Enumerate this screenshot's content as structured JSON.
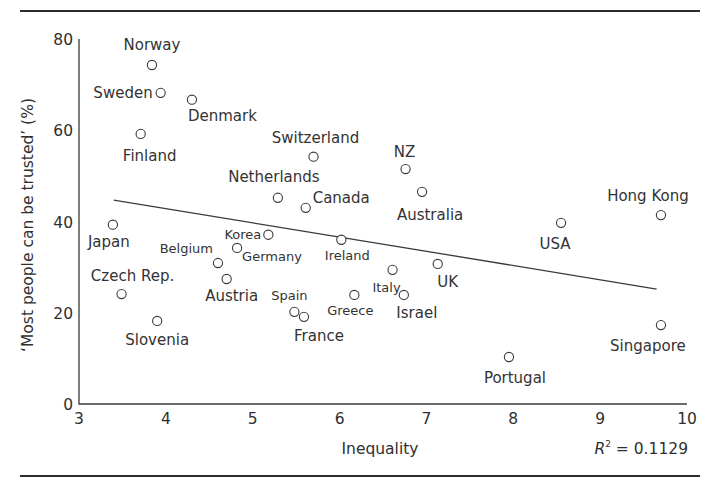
{
  "chart_data": {
    "type": "scatter",
    "title": "",
    "xlabel": "Inequality",
    "ylabel": "‘Most people can be trusted’ (%)",
    "xlim": [
      3,
      10
    ],
    "ylim": [
      0,
      80
    ],
    "x_ticks": [
      "3",
      "4",
      "5",
      "6",
      "7",
      "8",
      "9",
      "10"
    ],
    "y_ticks": [
      "0",
      "20",
      "40",
      "60",
      "80"
    ],
    "grid": false,
    "legend": null,
    "annotation": {
      "r2_label": "R",
      "r2_sup": "2",
      "r2_value": " = 0.1129"
    },
    "trendline": {
      "x": [
        3.4,
        9.65
      ],
      "y": [
        44.7,
        25.2
      ]
    },
    "points": [
      {
        "label": "Norway",
        "x": 3.84,
        "y": 74.3,
        "lx": 0,
        "ly": -15,
        "anchor": "middle",
        "size": "normal"
      },
      {
        "label": "Sweden",
        "x": 3.94,
        "y": 68.2,
        "lx": -8,
        "ly": 5,
        "anchor": "end",
        "size": "normal"
      },
      {
        "label": "Denmark",
        "x": 4.3,
        "y": 66.7,
        "lx": -4,
        "ly": 21,
        "anchor": "start",
        "size": "normal"
      },
      {
        "label": "Finland",
        "x": 3.71,
        "y": 59.2,
        "lx": 9,
        "ly": 27,
        "anchor": "middle",
        "size": "normal"
      },
      {
        "label": "Switzerland",
        "x": 5.7,
        "y": 54.2,
        "lx": 2,
        "ly": -14,
        "anchor": "middle",
        "size": "normal"
      },
      {
        "label": "NZ",
        "x": 6.76,
        "y": 51.5,
        "lx": -1,
        "ly": -12,
        "anchor": "middle",
        "size": "normal"
      },
      {
        "label": "Netherlands",
        "x": 5.29,
        "y": 45.2,
        "lx": -4,
        "ly": -16,
        "anchor": "middle",
        "size": "normal"
      },
      {
        "label": "Canada",
        "x": 5.61,
        "y": 43.0,
        "lx": 7,
        "ly": -5,
        "anchor": "start",
        "size": "normal"
      },
      {
        "label": "Australia",
        "x": 6.95,
        "y": 46.5,
        "lx": 8,
        "ly": 28,
        "anchor": "middle",
        "size": "normal"
      },
      {
        "label": "Japan",
        "x": 3.39,
        "y": 39.3,
        "lx": -4,
        "ly": 22,
        "anchor": "middle",
        "size": "normal"
      },
      {
        "label": "Korea",
        "x": 5.18,
        "y": 37.1,
        "lx": -7,
        "ly": 4,
        "anchor": "end",
        "size": "small"
      },
      {
        "label": "Ireland",
        "x": 6.02,
        "y": 36.0,
        "lx": 6,
        "ly": 20,
        "anchor": "middle",
        "size": "small"
      },
      {
        "label": "Germany",
        "x": 4.82,
        "y": 34.2,
        "lx": 5,
        "ly": 13,
        "anchor": "start",
        "size": "small"
      },
      {
        "label": "Belgium",
        "x": 4.6,
        "y": 30.9,
        "lx": -5,
        "ly": -10,
        "anchor": "end",
        "size": "small"
      },
      {
        "label": "Austria",
        "x": 4.7,
        "y": 27.4,
        "lx": 5,
        "ly": 22,
        "anchor": "middle",
        "size": "normal"
      },
      {
        "label": "Italy",
        "x": 6.61,
        "y": 29.4,
        "lx": -6,
        "ly": 22,
        "anchor": "middle",
        "size": "small"
      },
      {
        "label": "UK",
        "x": 7.13,
        "y": 30.7,
        "lx": 10,
        "ly": 23,
        "anchor": "middle",
        "size": "normal"
      },
      {
        "label": "Czech Rep.",
        "x": 3.49,
        "y": 24.1,
        "lx": 11,
        "ly": -13,
        "anchor": "middle",
        "size": "normal"
      },
      {
        "label": "Greece",
        "x": 6.17,
        "y": 23.9,
        "lx": -4,
        "ly": 20,
        "anchor": "middle",
        "size": "small"
      },
      {
        "label": "Israel",
        "x": 6.74,
        "y": 23.9,
        "lx": 13,
        "ly": 23,
        "anchor": "middle",
        "size": "normal"
      },
      {
        "label": "Spain",
        "x": 5.48,
        "y": 20.2,
        "lx": -5,
        "ly": -12,
        "anchor": "middle",
        "size": "small"
      },
      {
        "label": "France",
        "x": 5.59,
        "y": 19.1,
        "lx": 15,
        "ly": 24,
        "anchor": "middle",
        "size": "normal"
      },
      {
        "label": "Slovenia",
        "x": 3.9,
        "y": 18.2,
        "lx": 0,
        "ly": 24,
        "anchor": "middle",
        "size": "normal"
      },
      {
        "label": "USA",
        "x": 8.55,
        "y": 39.7,
        "lx": -6,
        "ly": 26,
        "anchor": "middle",
        "size": "normal"
      },
      {
        "label": "Hong Kong",
        "x": 9.7,
        "y": 41.4,
        "lx": -13,
        "ly": -14,
        "anchor": "middle",
        "size": "normal"
      },
      {
        "label": "Singapore",
        "x": 9.7,
        "y": 17.3,
        "lx": -13,
        "ly": 26,
        "anchor": "middle",
        "size": "normal"
      },
      {
        "label": "Portugal",
        "x": 7.95,
        "y": 10.3,
        "lx": 6,
        "ly": 26,
        "anchor": "middle",
        "size": "normal"
      }
    ]
  }
}
